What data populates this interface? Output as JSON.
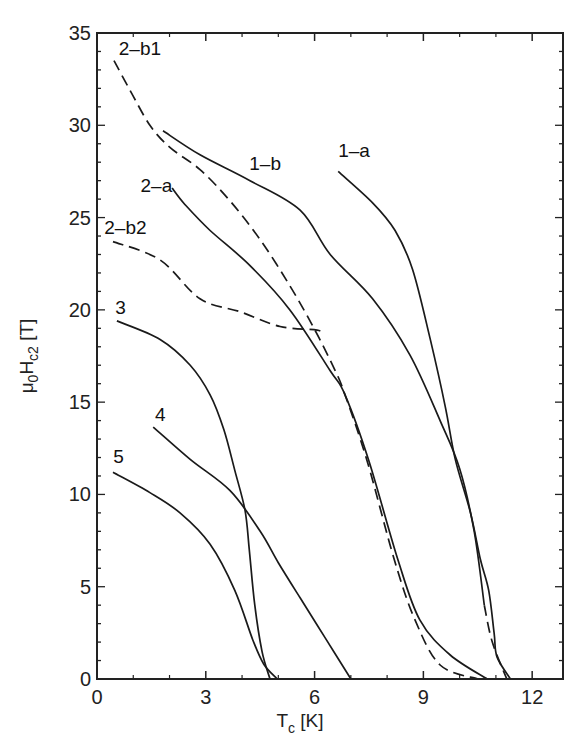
{
  "chart_data": {
    "type": "line",
    "title": "",
    "xlabel": "T_c [K]",
    "ylabel": "μ0Hc2 [T]",
    "xlim": [
      0,
      12.85
    ],
    "ylim": [
      0,
      35
    ],
    "x_major_ticks": [
      0,
      3,
      6,
      9,
      12
    ],
    "x_minor_ticks": [
      1,
      2,
      4,
      5,
      7,
      8,
      10,
      11
    ],
    "y_major_ticks": [
      0,
      5,
      10,
      15,
      20,
      25,
      30,
      35
    ],
    "y_minor_step": 1,
    "grid": false,
    "legend": "inline labels",
    "series": [
      {
        "name": "1-a",
        "style": "solid",
        "points": [
          [
            6.65,
            27.5
          ],
          [
            7.6,
            25.8
          ],
          [
            8.22,
            24.3
          ],
          [
            8.7,
            22.2
          ],
          [
            9.19,
            18.4
          ],
          [
            9.6,
            14.8
          ],
          [
            9.88,
            11.9
          ],
          [
            10.3,
            9.0
          ],
          [
            10.57,
            6.5
          ],
          [
            10.8,
            4.8
          ],
          [
            10.95,
            2.5
          ],
          [
            11.03,
            1.2
          ],
          [
            11.4,
            0
          ]
        ],
        "label_pos": [
          6.65,
          28.3
        ]
      },
      {
        "name": "1-b",
        "style": "solid",
        "dashed_tail": [
          [
            10.68,
            4.0
          ],
          [
            10.9,
            2.0
          ],
          [
            11.3,
            0
          ]
        ],
        "points": [
          [
            1.82,
            29.7
          ],
          [
            2.84,
            28.4
          ],
          [
            4.22,
            27.0
          ],
          [
            5.6,
            25.4
          ],
          [
            6.43,
            23.0
          ],
          [
            7.6,
            20.6
          ],
          [
            8.63,
            17.55
          ],
          [
            9.46,
            14.0
          ],
          [
            10.0,
            11.4
          ],
          [
            10.4,
            8.0
          ],
          [
            10.68,
            4.0
          ]
        ],
        "label_pos": [
          4.2,
          27.6
        ]
      },
      {
        "name": "2-a",
        "style": "solid",
        "points": [
          [
            2.07,
            26.6
          ],
          [
            2.43,
            25.7
          ],
          [
            3.12,
            24.3
          ],
          [
            4.22,
            22.4
          ],
          [
            5.32,
            20.0
          ],
          [
            6.43,
            16.7
          ],
          [
            6.84,
            15.4
          ],
          [
            7.5,
            11.8
          ],
          [
            8.3,
            6.45
          ],
          [
            8.9,
            3.2
          ],
          [
            9.74,
            1.3
          ],
          [
            10.76,
            0
          ]
        ],
        "label_pos": [
          1.2,
          26.4
        ]
      },
      {
        "name": "2-b1",
        "style": "dashed",
        "points": [
          [
            0.47,
            33.5
          ],
          [
            0.91,
            31.9
          ],
          [
            1.46,
            30.0
          ],
          [
            2.01,
            28.8
          ],
          [
            2.84,
            27.6
          ],
          [
            3.67,
            25.9
          ],
          [
            4.5,
            23.8
          ],
          [
            5.32,
            21.3
          ],
          [
            6.01,
            18.9
          ],
          [
            6.57,
            16.7
          ],
          [
            6.84,
            15.4
          ],
          [
            7.45,
            11.8
          ],
          [
            8.2,
            6.45
          ],
          [
            8.77,
            3.2
          ],
          [
            9.46,
            0.76
          ],
          [
            10.5,
            0
          ]
        ],
        "label_pos": [
          0.6,
          33.8
        ]
      },
      {
        "name": "2-b2",
        "style": "dashed",
        "points": [
          [
            0.44,
            23.7
          ],
          [
            1.74,
            22.7
          ],
          [
            2.84,
            20.6
          ],
          [
            3.94,
            19.9
          ],
          [
            5.05,
            19.1
          ],
          [
            6.07,
            18.9
          ],
          [
            6.2,
            18.7
          ]
        ],
        "label_pos": [
          0.2,
          24.1
        ]
      },
      {
        "name": "3",
        "style": "solid",
        "points": [
          [
            0.55,
            19.4
          ],
          [
            1.74,
            18.4
          ],
          [
            2.57,
            17.0
          ],
          [
            3.12,
            15.4
          ],
          [
            3.5,
            13.5
          ],
          [
            3.8,
            11.3
          ],
          [
            4.08,
            9.15
          ],
          [
            4.2,
            7.0
          ],
          [
            4.35,
            4.0
          ],
          [
            4.55,
            1.5
          ],
          [
            4.77,
            0
          ]
        ],
        "label_pos": [
          0.5,
          19.8
        ]
      },
      {
        "name": "4",
        "style": "solid",
        "points": [
          [
            1.55,
            13.65
          ],
          [
            2.57,
            11.9
          ],
          [
            3.67,
            10.2
          ],
          [
            4.5,
            8.0
          ],
          [
            5.0,
            6.3
          ],
          [
            5.6,
            4.4
          ],
          [
            6.3,
            2.2
          ],
          [
            7.0,
            0
          ]
        ],
        "label_pos": [
          1.6,
          14.0
        ]
      },
      {
        "name": "5",
        "style": "solid",
        "points": [
          [
            0.44,
            11.2
          ],
          [
            1.46,
            10.1
          ],
          [
            2.29,
            9.0
          ],
          [
            3.12,
            7.3
          ],
          [
            3.8,
            4.8
          ],
          [
            4.3,
            2.1
          ],
          [
            4.6,
            0.8
          ],
          [
            4.97,
            0
          ]
        ],
        "label_pos": [
          0.45,
          11.7
        ]
      }
    ]
  },
  "axes": {
    "x_title_main": "T",
    "x_title_sub": "c",
    "x_title_unit": " [K]",
    "y_title_mu": "μ",
    "y_title_mu_sub": "0",
    "y_title_H": "H",
    "y_title_H_sub": "c2",
    "y_title_unit": " [T]"
  }
}
